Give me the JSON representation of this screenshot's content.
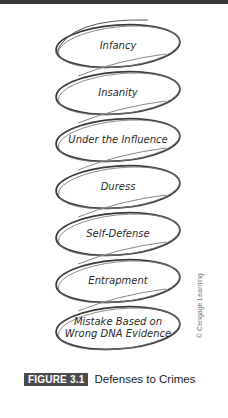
{
  "figure": {
    "number_label": "FIGURE 3.1",
    "title": "Defenses to Crimes",
    "credit": "© Cengage Learning"
  },
  "defenses": [
    {
      "label": "Infancy"
    },
    {
      "label": "Insanity"
    },
    {
      "label": "Under the Influence"
    },
    {
      "label": "Duress"
    },
    {
      "label": "Self-Defense"
    },
    {
      "label": "Entrapment"
    },
    {
      "label": "Mistake Based on\nWrong DNA Evidence"
    }
  ],
  "colors": {
    "stroke": "#3a3a3a",
    "badge": "#4a4a4a"
  }
}
